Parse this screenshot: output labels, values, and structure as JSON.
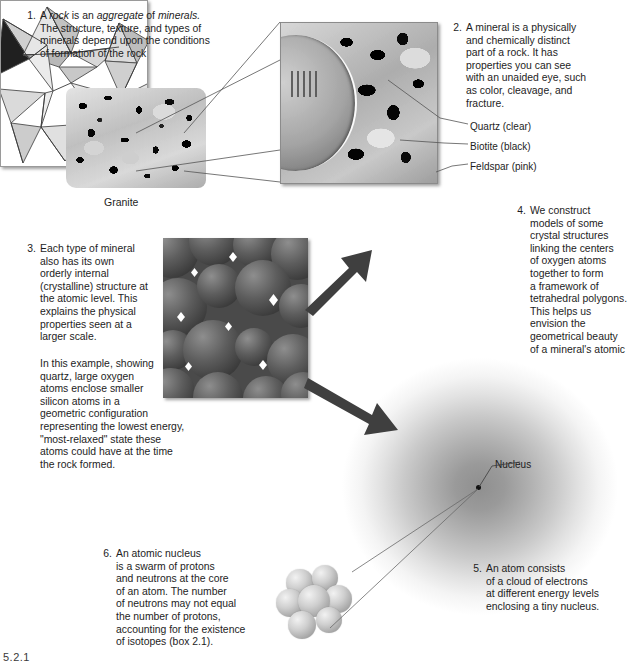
{
  "figure": {
    "bottom_mark": "5.2.1"
  },
  "panels": [
    {
      "number": "1.",
      "text": "A rock is an aggregate of minerals. The structure, texture, and types of minerals depend upon the conditions of formation of the rock",
      "lines": [
        "A rock is an aggregate of minerals.",
        "The structure, texture, and types of",
        "minerals depend upon the conditions",
        "of formation of the rock"
      ]
    },
    {
      "number": "2.",
      "text": "A mineral is a physically and chemically distinct part of a rock. It has properties you can see with an unaided eye, such as color, cleavage, and fracture.",
      "lines": [
        "A mineral is a physically",
        "and chemically distinct",
        "part of a rock. It has",
        "properties you can see",
        "with an unaided eye, such",
        "as color, cleavage, and",
        "fracture."
      ]
    },
    {
      "number": "3.",
      "text": "Each type of mineral also has its own orderly internal (crystalline) structure at the atomic level. This explains the physical properties seen at a larger scale.",
      "lines": [
        "Each type of mineral",
        "also has its own",
        "orderly internal",
        "(crystalline) structure at",
        "the atomic level. This",
        "explains the physical",
        "properties seen at a",
        "larger scale."
      ],
      "paragraph2": "In this example, showing quartz, large oxygen atoms enclose smaller silicon atoms in a geometric configuration representing the lowest energy, \"most-relaxed\" state these atoms could have at the time the rock formed.",
      "paragraph2_lines": [
        "In this example, showing",
        "quartz, large oxygen",
        "atoms enclose smaller",
        "silicon atoms in a",
        "geometric configuration",
        "representing the lowest energy,",
        "\"most-relaxed\" state these",
        "atoms could have at the time",
        "the rock formed."
      ]
    },
    {
      "number": "4.",
      "text": "We construct models of some crystal structures linking the centers of oxygen atoms together to form a framework of tetrahedral polygons. This helps us envision the geometrical beauty of a mineral's atomic arrangement.",
      "lines": [
        "We construct",
        "models of some",
        "crystal structures",
        "linking the centers",
        "of oxygen atoms",
        "together to form",
        "a framework of",
        "tetrahedral polygons.",
        "This helps us",
        "envision the",
        "geometrical beauty",
        "of a mineral's atomic",
        "arrangement."
      ]
    },
    {
      "number": "5.",
      "text": "An atom consists of a cloud of electrons at different energy levels enclosing a tiny nucleus.",
      "lines": [
        "An atom consists",
        "of a cloud of electrons",
        "at different energy levels",
        "enclosing a tiny nucleus."
      ]
    },
    {
      "number": "6.",
      "text": "An atomic nucleus is a swarm of protons and neutrons at the core of an atom. The number of neutrons may not equal the number of protons, accounting for the existence of isotopes (box 2.1).",
      "lines": [
        "An atomic nucleus",
        "is a swarm of protons",
        "and neutrons at the core",
        "of an atom. The number",
        "of neutrons may not equal",
        "the number of protons,",
        "accounting for the existence",
        "of isotopes (box 2.1)."
      ]
    }
  ],
  "captions": {
    "granite": "Granite"
  },
  "mineral_labels": [
    {
      "label": "Quartz (clear)",
      "mineral": "quartz",
      "color_note": "clear"
    },
    {
      "label": "Biotite (black)",
      "mineral": "biotite",
      "color_note": "black"
    },
    {
      "label": "Feldspar (pink)",
      "mineral": "feldspar",
      "color_note": "pink"
    }
  ],
  "atom_labels": {
    "nucleus": "Nucleus"
  },
  "colors": {
    "background": "#ffffff",
    "text": "#1d1d1d",
    "leader_line": "#4a4a4a",
    "arrow_fill": "#3f3f3f",
    "panel_border": "#9a9a9a",
    "electron_cloud_core": "#8f8f8f",
    "oxygen_atom": "#5d5d5d",
    "nucleon": "#cfcfcf"
  },
  "icons": {
    "arrow_to_crystal": "arrow-up-right-icon",
    "arrow_to_atom": "arrow-down-right-icon"
  }
}
